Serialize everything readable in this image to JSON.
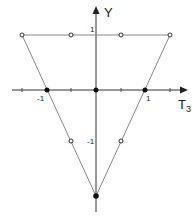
{
  "diagram": {
    "axes": {
      "x_label": "T",
      "x_label_sub": "3",
      "y_label": "Y",
      "tick_labels": {
        "x_neg1": "-1",
        "x_pos1": "1",
        "y_pos1": "1",
        "y_neg1": "-1"
      }
    },
    "triangle": {
      "vertices": [
        {
          "T3": -1.5,
          "Y": 1
        },
        {
          "T3": 1.5,
          "Y": 1
        },
        {
          "T3": 0,
          "Y": -2
        }
      ]
    },
    "points": {
      "filled": [
        {
          "T3": -1,
          "Y": 0
        },
        {
          "T3": 0,
          "Y": 0
        },
        {
          "T3": 1,
          "Y": 0
        },
        {
          "T3": 0,
          "Y": -2
        }
      ],
      "open": [
        {
          "T3": -1.5,
          "Y": 1
        },
        {
          "T3": -0.5,
          "Y": 1
        },
        {
          "T3": 0.5,
          "Y": 1
        },
        {
          "T3": 1.5,
          "Y": 1
        },
        {
          "T3": -0.5,
          "Y": -1
        },
        {
          "T3": 0.5,
          "Y": -1
        }
      ]
    },
    "colors": {
      "line": "#888888",
      "axis": "#333333",
      "point": "#222222"
    }
  }
}
